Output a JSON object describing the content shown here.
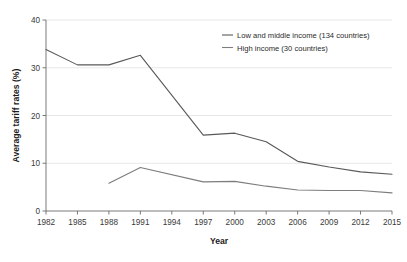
{
  "chart_data": {
    "type": "line",
    "title": "",
    "xlabel": "Year",
    "ylabel": "Average tariff rates (%)",
    "x": [
      1982,
      1985,
      1988,
      1991,
      1994,
      1997,
      2000,
      2003,
      2006,
      2009,
      2012,
      2015
    ],
    "categories": [
      "1982",
      "1985",
      "1988",
      "1991",
      "1994",
      "1997",
      "2000",
      "2003",
      "2006",
      "2009",
      "2012",
      "2015"
    ],
    "xlim": [
      1982,
      2015
    ],
    "ylim": [
      0,
      40
    ],
    "yticks": [
      0,
      10,
      20,
      30,
      40
    ],
    "ytick_labels": [
      "0",
      "10",
      "20",
      "30",
      "40"
    ],
    "xticks": [
      1982,
      1985,
      1988,
      1991,
      1994,
      1997,
      2000,
      2003,
      2006,
      2009,
      2012,
      2015
    ],
    "grid": "horizontal",
    "legend_position": "top-right",
    "series": [
      {
        "name": "Low and middle income (134 countries)",
        "color": "#595959",
        "x": [
          1982,
          1985,
          1988,
          1991,
          1997,
          2000,
          2003,
          2006,
          2009,
          2012,
          2015
        ],
        "values": [
          33.8,
          30.6,
          30.6,
          32.6,
          15.9,
          16.3,
          14.5,
          10.4,
          9.2,
          8.2,
          7.7
        ]
      },
      {
        "name": "High income (30 countries)",
        "color": "#7d7d7d",
        "x": [
          1988,
          1991,
          1997,
          2000,
          2003,
          2006,
          2009,
          2012,
          2015
        ],
        "values": [
          5.8,
          9.1,
          6.1,
          6.2,
          5.2,
          4.4,
          4.3,
          4.3,
          3.8
        ]
      }
    ]
  },
  "legend": {
    "items": [
      {
        "label": "Low and middle income (134 countries)"
      },
      {
        "label": "High income (30 countries)"
      }
    ]
  },
  "colors": {
    "series_low_middle": "#595959",
    "series_high": "#7d7d7d",
    "axis": "#6b6b6b",
    "grid": "#e2e2e2",
    "text": "#231f20",
    "background": "#ffffff"
  }
}
